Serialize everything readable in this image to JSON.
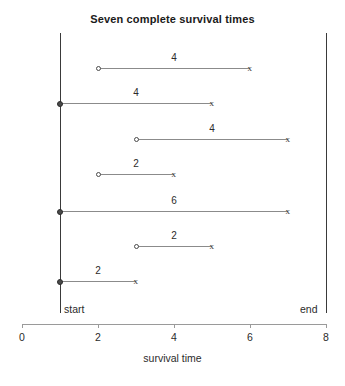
{
  "chart_data": {
    "type": "table",
    "title": "Seven complete survival times",
    "xlabel": "survival time",
    "ylabel": "",
    "xlim": [
      0,
      8
    ],
    "xticks": [
      0,
      2,
      4,
      6,
      8
    ],
    "xtick_labels": [
      "0",
      "2",
      "4",
      "6",
      "8"
    ],
    "grid": false,
    "legend": "none",
    "reference_lines": [
      {
        "name": "start",
        "label": "start",
        "x": 1
      },
      {
        "name": "end",
        "label": "end",
        "x": 8
      }
    ],
    "series": [
      {
        "name": "subject-1",
        "start": 2,
        "end": 6,
        "duration": 4,
        "duration_label": "4",
        "start_marker": "open-circle",
        "end_marker": "x"
      },
      {
        "name": "subject-2",
        "start": 1,
        "end": 5,
        "duration": 4,
        "duration_label": "4",
        "start_marker": "filled-circle",
        "end_marker": "x"
      },
      {
        "name": "subject-3",
        "start": 3,
        "end": 7,
        "duration": 4,
        "duration_label": "4",
        "start_marker": "open-circle",
        "end_marker": "x"
      },
      {
        "name": "subject-4",
        "start": 2,
        "end": 4,
        "duration": 2,
        "duration_label": "2",
        "start_marker": "open-circle",
        "end_marker": "x"
      },
      {
        "name": "subject-5",
        "start": 1,
        "end": 7,
        "duration": 6,
        "duration_label": "6",
        "start_marker": "filled-circle",
        "end_marker": "x"
      },
      {
        "name": "subject-6",
        "start": 3,
        "end": 5,
        "duration": 2,
        "duration_label": "2",
        "start_marker": "open-circle",
        "end_marker": "x"
      },
      {
        "name": "subject-7",
        "start": 1,
        "end": 3,
        "duration": 2,
        "duration_label": "2",
        "start_marker": "filled-circle",
        "end_marker": "x"
      }
    ],
    "marker_glyphs": {
      "x": "x"
    },
    "colors": {
      "segment": "#8b8b8b",
      "reference_line": "#3a3a3a",
      "axis": "#9a9a9a",
      "text": "#2b2b2b",
      "marker_fill": "#4a4a4a",
      "background": "#ffffff"
    }
  },
  "layout": {
    "plot_x0_px": 22,
    "plot_x8_px": 326,
    "row_y_px": [
      68,
      103,
      139,
      174,
      211,
      246,
      281
    ],
    "reference_line_top_px": 33,
    "reference_line_bottom_px": 313,
    "axis_y_px": 324
  }
}
